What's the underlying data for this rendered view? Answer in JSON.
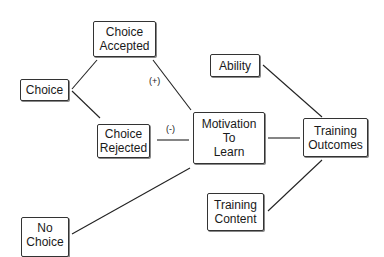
{
  "diagram": {
    "nodes": {
      "choice": {
        "lines": [
          "Choice"
        ]
      },
      "choice_accepted": {
        "lines": [
          "Choice",
          "Accepted"
        ]
      },
      "choice_rejected": {
        "lines": [
          "Choice",
          "Rejected"
        ]
      },
      "no_choice": {
        "lines": [
          "No",
          "Choice"
        ]
      },
      "motivation": {
        "lines": [
          "Motivation",
          "To",
          "Learn"
        ]
      },
      "ability": {
        "lines": [
          "Ability"
        ]
      },
      "training_content": {
        "lines": [
          "Training",
          "Content"
        ]
      },
      "training_outcomes": {
        "lines": [
          "Training",
          "Outcomes"
        ]
      }
    },
    "edge_labels": {
      "positive": "(+)",
      "negative": "(-)"
    },
    "edges": [
      {
        "from": "choice",
        "to": "choice_accepted"
      },
      {
        "from": "choice",
        "to": "choice_rejected"
      },
      {
        "from": "choice_accepted",
        "to": "motivation",
        "label": "(+)"
      },
      {
        "from": "choice_rejected",
        "to": "motivation",
        "label": "(-)"
      },
      {
        "from": "no_choice",
        "to": "motivation"
      },
      {
        "from": "motivation",
        "to": "training_outcomes"
      },
      {
        "from": "ability",
        "to": "training_outcomes"
      },
      {
        "from": "training_content",
        "to": "training_outcomes"
      }
    ]
  }
}
